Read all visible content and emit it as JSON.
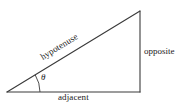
{
  "diagram": {
    "type": "right-triangle-trigonometry",
    "background_color": "#ffffff",
    "line_color": "#3a3a3a",
    "text_color": "#1a1a1a",
    "vertices": {
      "left_acute": [
        7,
        92
      ],
      "right_angle": [
        140,
        92
      ],
      "apex": [
        140,
        11
      ]
    },
    "sides": [
      {
        "name": "hypotenuse",
        "label": "hypotenuse",
        "from": [
          7,
          92
        ],
        "to": [
          140,
          11
        ],
        "label_rotation_deg": -31.3
      },
      {
        "name": "opposite",
        "label": "opposite",
        "from": [
          140,
          11
        ],
        "to": [
          140,
          92
        ],
        "label_rotation_deg": 0
      },
      {
        "name": "adjacent",
        "label": "adjacent",
        "from": [
          7,
          92
        ],
        "to": [
          140,
          92
        ],
        "label_rotation_deg": 0
      }
    ],
    "angle": {
      "name": "theta",
      "label": "θ",
      "vertex": [
        7,
        92
      ],
      "arc_radius": 33,
      "measure_deg": 31.3
    }
  }
}
